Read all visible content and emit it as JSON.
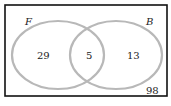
{
  "diagram": {
    "type": "venn",
    "sets": [
      {
        "name": "F",
        "only_count": "29"
      },
      {
        "name": "B",
        "only_count": "13"
      }
    ],
    "intersection": "5",
    "outside": "98",
    "colors": {
      "circle_stroke": "#b8b8b8",
      "border": "#111111"
    }
  }
}
